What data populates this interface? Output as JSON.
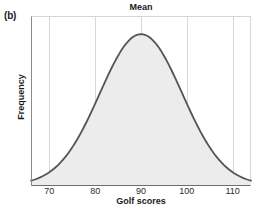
{
  "figure": {
    "panel_label": "(b)",
    "background_color": "#ffffff"
  },
  "chart_data": {
    "type": "area",
    "title": "Mean",
    "xlabel": "Golf scores",
    "ylabel": "Frequency",
    "xlim": [
      66,
      114
    ],
    "ylim": [
      0,
      1.12
    ],
    "xticks": [
      70,
      80,
      90,
      100,
      110
    ],
    "xtick_labels": [
      "70",
      "80",
      "90",
      "100",
      "110"
    ],
    "yticks": [],
    "ytick_labels": [],
    "grid": "vertical-only",
    "legend": "none",
    "distribution": "normal",
    "mean": 90,
    "std_dev": 9,
    "peak_x": 90,
    "peak_y": 1.0,
    "x": [
      66,
      68,
      70,
      72,
      74,
      76,
      78,
      80,
      82,
      84,
      86,
      88,
      90,
      92,
      94,
      96,
      98,
      100,
      102,
      104,
      106,
      108,
      110,
      112,
      114
    ],
    "y": [
      0.005,
      0.011,
      0.024,
      0.047,
      0.085,
      0.142,
      0.222,
      0.324,
      0.442,
      0.565,
      0.68,
      0.78,
      0.862,
      0.92,
      0.953,
      0.962,
      0.947,
      0.862,
      0.78,
      0.68,
      0.565,
      0.442,
      0.324,
      0.142,
      0.047
    ],
    "curve_color": "#555555",
    "fill_color": "#ececec",
    "gridline_color": "#d8d8d8",
    "border_color": "#d0d0d0",
    "axis_color": "#6e6e6e"
  },
  "annotations": {
    "mean_line_x": 90,
    "mean_label": "Mean"
  }
}
